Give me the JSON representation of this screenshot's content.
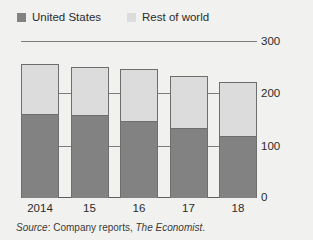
{
  "legend": {
    "entries": [
      {
        "label": "United States",
        "color": "#828282",
        "icon": "legend-swatch-square"
      },
      {
        "label": "Rest of world",
        "color": "#dcdcdc",
        "icon": "legend-swatch-square"
      }
    ]
  },
  "axis": {
    "y_ticks": [
      "300",
      "200",
      "100",
      "0"
    ],
    "x_ticks": [
      "2014",
      "15",
      "16",
      "17",
      "18"
    ]
  },
  "source": {
    "prefix": "Source",
    "separator": ": ",
    "text": "Company reports, ",
    "publication": "The Economist",
    "period": "."
  },
  "colors": {
    "united_states": "#828282",
    "rest_of_world": "#dcdcdc",
    "background": "#f1f1ef",
    "gridline": "#7d7d7d",
    "bar_outline": "#6e6e6e",
    "text": "#2b2b2b"
  },
  "chart_data": {
    "type": "bar",
    "subtype": "stacked-vertical",
    "title": "",
    "subtitle": "",
    "xlabel": "",
    "ylabel": "",
    "ylim": [
      0,
      300
    ],
    "ytick_values": [
      0,
      100,
      200,
      300
    ],
    "grid": true,
    "gridlines": "horizontal",
    "legend_position": "top-left",
    "categories": [
      "2014",
      "15",
      "16",
      "17",
      "18"
    ],
    "series": [
      {
        "name": "United States",
        "color": "#828282",
        "values": [
          162,
          160,
          149,
          134,
          120
        ]
      },
      {
        "name": "Rest of world",
        "color": "#dcdcdc",
        "values": [
          96,
          92,
          99,
          101,
          104
        ]
      }
    ],
    "totals": [
      258,
      252,
      248,
      235,
      224
    ],
    "source": "Company reports, The Economist"
  }
}
